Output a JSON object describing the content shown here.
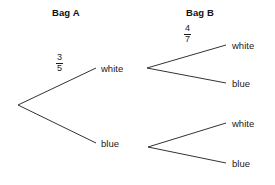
{
  "diagram": {
    "type": "probability-tree",
    "headers": [
      {
        "label": "Bag A",
        "x": 52,
        "y": 7
      },
      {
        "label": "Bag B",
        "x": 186,
        "y": 7
      }
    ],
    "stroke_color": "#333333",
    "background_color": "#ffffff",
    "root": {
      "x": 18,
      "y": 105
    },
    "level1": {
      "nodes": [
        {
          "id": "a-white",
          "label": "white",
          "x": 101,
          "y": 63,
          "node_x": 96,
          "node_y": 68
        },
        {
          "id": "a-blue",
          "label": "blue",
          "x": 101,
          "y": 138,
          "node_x": 96,
          "node_y": 143
        }
      ],
      "branch_labels": [
        {
          "for": "a-white",
          "numerator": "3",
          "denominator": "5",
          "x": 56,
          "y": 53
        }
      ]
    },
    "level2": {
      "junctions": [
        {
          "id": "j-top",
          "x": 147,
          "y": 68
        },
        {
          "id": "j-bottom",
          "x": 148,
          "y": 147
        }
      ],
      "nodes": [
        {
          "id": "b-white-1",
          "parent": "j-top",
          "label": "white",
          "x": 232,
          "y": 40,
          "tip_x": 226,
          "tip_y": 45
        },
        {
          "id": "b-blue-1",
          "parent": "j-top",
          "label": "blue",
          "x": 232,
          "y": 78,
          "tip_x": 226,
          "tip_y": 83
        },
        {
          "id": "b-white-2",
          "parent": "j-bottom",
          "label": "white",
          "x": 232,
          "y": 118,
          "tip_x": 226,
          "tip_y": 123
        },
        {
          "id": "b-blue-2",
          "parent": "j-bottom",
          "label": "blue",
          "x": 232,
          "y": 158,
          "tip_x": 226,
          "tip_y": 163
        }
      ],
      "branch_labels": [
        {
          "for": "b-white-1",
          "numerator": "4",
          "denominator": "7",
          "x": 184,
          "y": 24
        }
      ]
    }
  }
}
